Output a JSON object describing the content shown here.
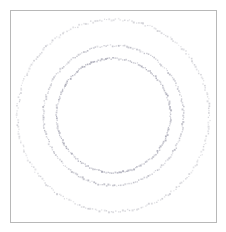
{
  "figure": {
    "background_color": "#ffffff",
    "width": 226,
    "height": 232
  },
  "frame": {
    "label": "plot-frame",
    "x": 10,
    "y": 10,
    "width": 207,
    "height": 213,
    "border_color": "#b8b8b8",
    "border_width": 1,
    "fill_color": "#ffffff"
  },
  "chart_data": {
    "type": "scatter",
    "title": "",
    "subtitle": "",
    "xlabel": "",
    "ylabel": "",
    "xlim": [
      -1.15,
      1.15
    ],
    "ylim": [
      -1.15,
      1.15
    ],
    "grid": false,
    "legend": null,
    "axis_ticks_visible": false,
    "axis_labels_visible": false,
    "marker": {
      "shape": "square",
      "size_px": 1.4,
      "edge": "none"
    },
    "center": {
      "cx": 113.5,
      "cy": 115.5
    },
    "series": [
      {
        "name": "outer-ring",
        "radius_px": 96,
        "n_points": 260,
        "color": "#c9c9cf",
        "opacity": 0.85,
        "jitter_px": 1.1,
        "phase_deg": 0
      },
      {
        "name": "middle-ring",
        "radius_px": 70,
        "n_points": 210,
        "color": "#b6b6c0",
        "opacity": 0.9,
        "jitter_px": 0.9,
        "phase_deg": 17
      },
      {
        "name": "inner-ring",
        "radius_px": 57,
        "n_points": 190,
        "color": "#a9a9b6",
        "opacity": 0.95,
        "jitter_px": 0.8,
        "phase_deg": 33
      }
    ]
  }
}
